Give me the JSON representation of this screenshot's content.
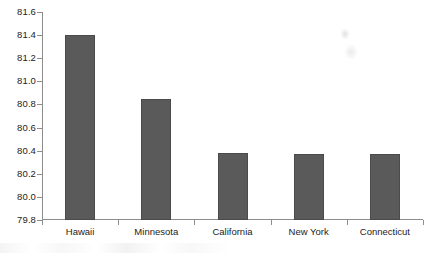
{
  "chart_data": {
    "type": "bar",
    "title": "",
    "subtitle": "",
    "xlabel": "",
    "ylabel": "",
    "categories": [
      "Hawaii",
      "Minnesota",
      "California",
      "New York",
      "Connecticut"
    ],
    "values": [
      81.4,
      80.85,
      80.38,
      80.37,
      80.37
    ],
    "series": [
      {
        "name": "",
        "values": [
          81.4,
          80.85,
          80.38,
          80.37,
          80.37
        ]
      }
    ],
    "ylim": [
      79.8,
      81.6
    ],
    "ytick_labels": [
      "81.6",
      "81.4",
      "81.2",
      "81.0",
      "80.8",
      "80.6",
      "80.4",
      "80.2",
      "80.0",
      "79.8"
    ],
    "ytick_values": [
      81.6,
      81.4,
      81.2,
      81.0,
      80.8,
      80.6,
      80.4,
      80.2,
      80.0,
      79.8
    ],
    "ytick_step": 0.2,
    "grid": false,
    "legend": false,
    "legend_position": "none",
    "annotations": [],
    "bar_color": "#5a5a5a",
    "bar_edge_color": "#4a4a4a",
    "axis_color": "#8d8d8d",
    "background_color": "#ffffff",
    "text_color": "#1c1c1c"
  }
}
